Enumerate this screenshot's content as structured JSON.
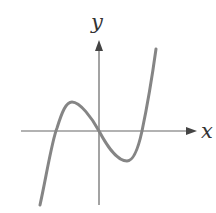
{
  "diagram": {
    "type": "function-graph",
    "axes": {
      "x_label": "x",
      "y_label": "y",
      "axis_color": "#666666"
    },
    "curve": {
      "color": "#858585",
      "shape": "cubic"
    }
  }
}
